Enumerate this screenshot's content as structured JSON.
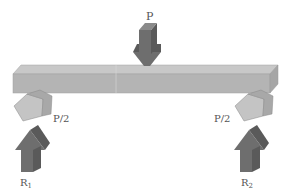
{
  "diagram": {
    "labels": {
      "applied_load": "P",
      "left_reaction_share": "P/2",
      "right_reaction_share": "P/2",
      "left_reaction": "R",
      "left_reaction_sub": "1",
      "right_reaction": "R",
      "right_reaction_sub": "2"
    },
    "colors": {
      "beam_front": "#b4b4b4",
      "beam_top": "#c8c8c8",
      "beam_side": "#a6a6a6",
      "arrow_dark": "#6e6e6e",
      "arrow_darker": "#5a5a5a",
      "pentagon_light": "#c4c4c4",
      "pentagon_side": "#a8a8a8",
      "label": "#555555"
    }
  }
}
